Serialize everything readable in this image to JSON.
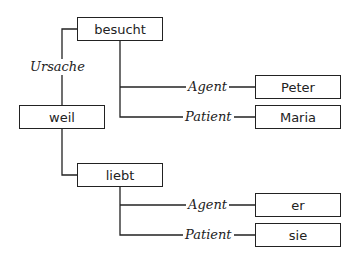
{
  "nodes": {
    "besucht": "besucht",
    "weil": "weil",
    "peter": "Peter",
    "maria": "Maria",
    "liebt": "liebt",
    "er": "er",
    "sie": "sie"
  },
  "edges": {
    "ursache": "Ursache",
    "agent1": "Agent",
    "patient1": "Patient",
    "agent2": "Agent",
    "patient2": "Patient"
  }
}
